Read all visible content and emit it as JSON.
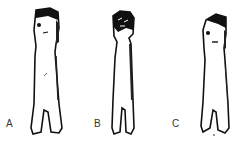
{
  "figures": [
    {
      "label": "A",
      "description": "figurine with head band, eye and mouth marks"
    },
    {
      "label": "B",
      "description": "figurine with textured dark head"
    },
    {
      "label": "C",
      "description": "figurine with angled head band, eye and mouth marks"
    }
  ],
  "colors": {
    "ink": "#111111",
    "paper": "#ffffff"
  }
}
